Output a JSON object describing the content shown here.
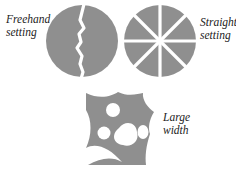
{
  "labels": {
    "freehand": [
      "Freehand",
      "setting"
    ],
    "straight": [
      "Straight",
      "setting"
    ],
    "large": [
      "Large",
      "width"
    ]
  },
  "colors": {
    "fill": "#8f8f8f",
    "background": "#ffffff",
    "text": "#222222"
  }
}
